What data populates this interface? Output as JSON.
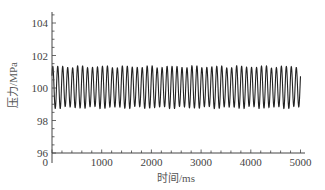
{
  "chart_data": {
    "type": "line",
    "title": "",
    "xlabel": "时间/ms",
    "ylabel": "压力/MPa",
    "xlim": [
      0,
      5000
    ],
    "ylim": [
      96,
      104.5
    ],
    "x_ticks": [
      0,
      1000,
      2000,
      3000,
      4000,
      5000
    ],
    "x_tick_labels": [
      "0",
      "1000",
      "2000",
      "3000",
      "4000",
      "5000"
    ],
    "y_ticks": [
      96,
      98,
      100,
      102,
      104
    ],
    "y_tick_labels": [
      "96",
      "98",
      "100",
      "102",
      "104"
    ],
    "grid": false,
    "legend": null,
    "series": [
      {
        "name": "pressure",
        "description": "Periodic oscillation about 100 MPa, ~10 Hz, from 0 to 5000 ms",
        "mean": 100.0,
        "max": 101.3,
        "min": 98.8,
        "frequency_hz": 10,
        "t_start": 0,
        "t_end": 5000,
        "color": "#222222"
      }
    ]
  }
}
